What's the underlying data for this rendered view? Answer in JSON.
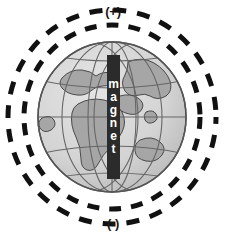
{
  "figure": {
    "background_color": "#ffffff"
  },
  "labels": {
    "top_pole": "(+)",
    "bottom_pole": "(-)"
  },
  "magnet": {
    "label": "magnet",
    "letters": [
      "m",
      "a",
      "g",
      "n",
      "e",
      "t"
    ],
    "bar_color": "#2b2b2b",
    "text_color": "#ffffff"
  },
  "globe": {
    "ocean_color": "#d6d6d6",
    "land_color": "#a6a6a6",
    "outline_color": "#555555",
    "graticule_color": "#666666",
    "center_x": 112,
    "center_y": 117,
    "radius_x": 74,
    "radius_y": 75
  },
  "field_lines": {
    "dash_color": "#111111",
    "dash_pattern": "11 9",
    "stroke_width": 5,
    "ellipses": [
      {
        "name": "inner-field-line",
        "rx": 88,
        "ry": 92
      },
      {
        "name": "outer-field-line",
        "rx": 104,
        "ry": 107
      }
    ]
  }
}
